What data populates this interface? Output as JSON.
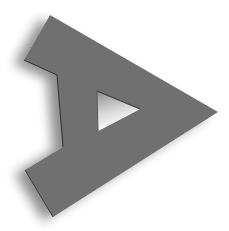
{
  "logo": {
    "icon": "play-arrow-logo-icon",
    "fill_color": "#707070",
    "shadow_color": "#000000",
    "hole_fill_top": "#9a9a9a",
    "hole_fill_bottom": "#ffffff",
    "background": "#ffffff",
    "outer_shape": [
      [
        50,
        15
      ],
      [
        218,
        112
      ],
      [
        53,
        217
      ],
      [
        25,
        170
      ],
      [
        63,
        147
      ],
      [
        57,
        75
      ],
      [
        24,
        60
      ]
    ],
    "hole_triangle": [
      [
        97,
        91
      ],
      [
        140,
        109
      ],
      [
        98,
        131
      ]
    ]
  }
}
